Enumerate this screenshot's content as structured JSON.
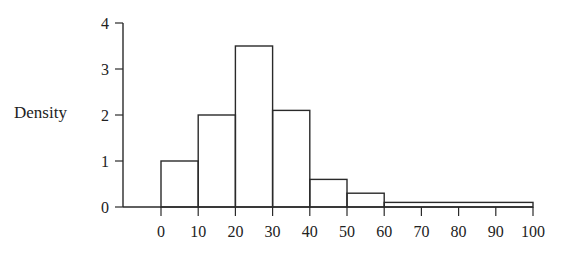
{
  "chart_data": {
    "type": "bar",
    "subtype": "histogram",
    "title": "",
    "xlabel": "",
    "ylabel": "Density",
    "bins": [
      {
        "start": 0,
        "end": 10,
        "density": 1.0
      },
      {
        "start": 10,
        "end": 20,
        "density": 2.0
      },
      {
        "start": 20,
        "end": 30,
        "density": 3.5
      },
      {
        "start": 30,
        "end": 40,
        "density": 2.1
      },
      {
        "start": 40,
        "end": 50,
        "density": 0.6
      },
      {
        "start": 50,
        "end": 60,
        "density": 0.3
      },
      {
        "start": 60,
        "end": 100,
        "density": 0.1
      }
    ],
    "x_ticks": [
      0,
      10,
      20,
      30,
      40,
      50,
      60,
      70,
      80,
      90,
      100
    ],
    "y_ticks": [
      0,
      1,
      2,
      3,
      4
    ],
    "xlim": [
      0,
      100
    ],
    "ylim": [
      0,
      4
    ],
    "grid": false,
    "legend": null
  }
}
